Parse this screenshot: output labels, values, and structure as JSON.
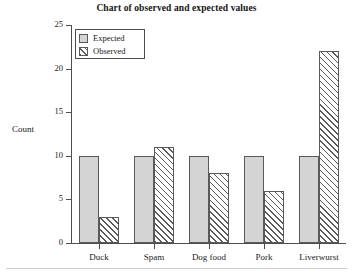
{
  "chart_data": {
    "type": "bar",
    "title": "Chart of observed and expected values",
    "xlabel": "",
    "ylabel": "Count",
    "categories": [
      "Duck",
      "Spam",
      "Dog food",
      "Pork",
      "Liverwurst"
    ],
    "series": [
      {
        "name": "Expected",
        "values": [
          10,
          10,
          10,
          10,
          10
        ]
      },
      {
        "name": "Observed",
        "values": [
          3,
          11,
          8,
          6,
          22
        ]
      }
    ],
    "ylim": [
      0,
      25
    ],
    "yticks": [
      0,
      5,
      10,
      15,
      20,
      25
    ],
    "ytick_labels": [
      "0",
      "5",
      "10",
      "15",
      "20",
      "25"
    ],
    "grid": false,
    "legend_position": "upper left",
    "colors": {
      "expected_fill": "#d4d4d4",
      "observed_fill": "#ffffff",
      "observed_hatch": "#5a5a5a",
      "bar_edge": "#595959",
      "axis": "#4d4d4d",
      "text": "#1a1a1a",
      "background": "#ffffff"
    }
  },
  "legend": {
    "items": [
      {
        "label": "Expected",
        "swatch": "solid-gray-square-icon"
      },
      {
        "label": "Observed",
        "swatch": "diagonal-hatch-square-icon"
      }
    ]
  }
}
